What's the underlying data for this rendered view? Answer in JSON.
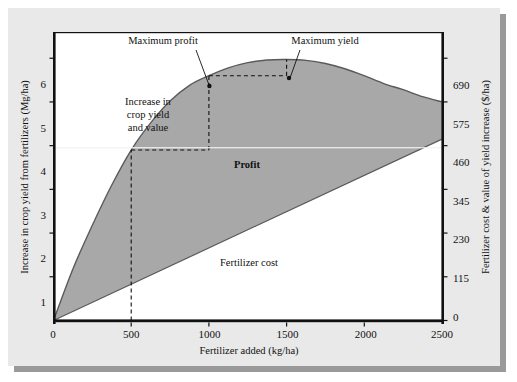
{
  "figure": {
    "background": "#e9e9e9",
    "plot_background": "#ffffff",
    "fill_color": "#a8a8a8",
    "axis_color": "#111111"
  },
  "chart_data": {
    "type": "area",
    "title": "",
    "xlabel": "Fertilizer added (kg/ha)",
    "ylabel": "Increase in crop yield from fertilizers (Mg/ha)",
    "y2label": "Fertilizer cost & value of yield increase ($/ha)",
    "xlim": [
      0,
      2500
    ],
    "ylim": [
      0,
      6.6
    ],
    "y2lim": [
      0,
      759
    ],
    "grid": false,
    "legend": "none",
    "xticks": [
      0,
      500,
      1000,
      1500,
      2000,
      2500
    ],
    "xtick_labels": [
      "0",
      "500",
      "1000",
      "1500",
      "2000",
      "2500"
    ],
    "yticks": [
      1,
      2,
      3,
      4,
      5,
      6
    ],
    "ytick_labels": [
      "1",
      "2",
      "3",
      "4",
      "5",
      "6"
    ],
    "y2ticks": [
      0,
      115,
      230,
      345,
      460,
      575,
      690
    ],
    "y2tick_labels": [
      "0",
      "115",
      "230",
      "345",
      "460",
      "575",
      "690"
    ],
    "series": [
      {
        "name": "Increase in crop yield and value",
        "kind": "curve",
        "x": [
          0,
          125,
          250,
          375,
          500,
          625,
          750,
          875,
          1000,
          1125,
          1250,
          1375,
          1500,
          1625,
          1750,
          1875,
          2000,
          2125,
          2250,
          2375,
          2500
        ],
        "y": [
          0.0,
          1.18,
          2.18,
          3.1,
          3.9,
          4.52,
          5.02,
          5.38,
          5.6,
          5.78,
          5.9,
          5.96,
          5.97,
          5.95,
          5.88,
          5.76,
          5.6,
          5.42,
          5.28,
          5.12,
          5.0
        ]
      },
      {
        "name": "Fertilizer cost",
        "kind": "line",
        "x": [
          0,
          2500
        ],
        "y": [
          0.0,
          4.15
        ]
      }
    ],
    "annotations": [
      {
        "name": "maximum-profit",
        "text": "Maximum profit",
        "point_x": 1000,
        "point_y": 5.6
      },
      {
        "name": "maximum-yield",
        "text": "Maximum yield",
        "point_x": 1500,
        "point_y": 5.97
      },
      {
        "name": "yield-value-label",
        "text": [
          "Increase in",
          "crop yield",
          "and value"
        ]
      },
      {
        "name": "profit-label",
        "text": "Profit"
      },
      {
        "name": "fertilizer-cost-label",
        "text": "Fertilizer cost"
      }
    ],
    "guides": [
      {
        "name": "guide-500",
        "from": [
          500,
          0
        ],
        "to": [
          500,
          3.9
        ]
      },
      {
        "name": "guide-500-to-1000",
        "from": [
          500,
          3.9
        ],
        "to": [
          1000,
          3.9
        ]
      },
      {
        "name": "guide-1000",
        "from": [
          1000,
          3.9
        ],
        "to": [
          1000,
          5.6
        ]
      },
      {
        "name": "guide-1000-to-1500",
        "from": [
          1000,
          5.6
        ],
        "to": [
          1500,
          5.6
        ]
      },
      {
        "name": "guide-1500",
        "from": [
          1500,
          5.6
        ],
        "to": [
          1500,
          5.97
        ]
      }
    ]
  },
  "labels": {
    "y_axis_title": "Increase in crop yield from fertilizers (Mg/ha)",
    "y2_axis_title": "Fertilizer cost & value of yield increase ($/ha)",
    "x_axis_title": "Fertilizer added (kg/ha)",
    "max_profit": "Maximum profit",
    "max_yield": "Maximum yield",
    "increase_line1": "Increase in",
    "increase_line2": "crop yield",
    "increase_line3": "and value",
    "profit": "Profit",
    "fertilizer_cost": "Fertilizer cost",
    "x0": "0",
    "x500": "500",
    "x1000": "1000",
    "x1500": "1500",
    "x2000": "2000",
    "x2500": "2500",
    "y1": "1",
    "y2": "2",
    "y3": "3",
    "y4": "4",
    "y5": "5",
    "y6": "6",
    "r0": "0",
    "r115": "115",
    "r230": "230",
    "r345": "345",
    "r460": "460",
    "r575": "575",
    "r690": "690"
  }
}
